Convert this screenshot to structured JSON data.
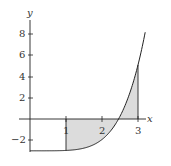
{
  "chart_data": {
    "type": "line",
    "title": "",
    "xlabel": "x",
    "ylabel": "y",
    "x_ticks": [
      "1",
      "2",
      "3"
    ],
    "y_ticks": [
      "8",
      "6",
      "4",
      "2",
      "−2"
    ],
    "xlim": [
      0,
      3.3
    ],
    "ylim": [
      -3.5,
      9
    ],
    "function": "approximately y = x^5/30 - 3",
    "x": [
      0,
      0.5,
      1,
      1.5,
      2,
      2.5,
      3,
      3.2
    ],
    "y": [
      -3,
      -3,
      -2.97,
      -2.75,
      -1.93,
      0.26,
      5.1,
      8.2
    ],
    "shaded_region": {
      "from_x": 1,
      "to_x": 3,
      "between": "curve and x-axis",
      "fill": "#d9d9d9"
    },
    "vertical_lines_at_x": [
      1,
      3
    ],
    "grid": false,
    "legend": null
  },
  "labels": {
    "x_axis": "x",
    "y_axis": "y",
    "tick1": "1",
    "tick2": "2",
    "tick3": "3",
    "y8": "8",
    "y6": "6",
    "y4": "4",
    "y2": "2",
    "yneg2": "−2"
  }
}
